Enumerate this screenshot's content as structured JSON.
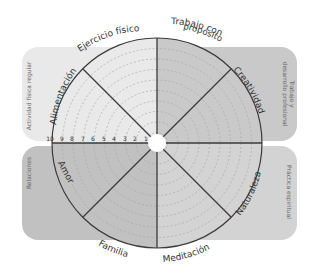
{
  "diagram": {
    "type": "wheel-of-life",
    "center": [
      157,
      143
    ],
    "radius": 105,
    "ring_count": 10,
    "scale_labels": [
      "10",
      "9",
      "8",
      "7",
      "6",
      "5",
      "4",
      "3",
      "2",
      "1"
    ],
    "segments": [
      {
        "label": "Ejercicio físico",
        "area": "top-left"
      },
      {
        "label": "Trabajo con propósito",
        "line1": "Trabajo con",
        "line2": "propósito",
        "area": "top-right"
      },
      {
        "label": "Creatividad",
        "area": "top-right"
      },
      {
        "label": "Naturaleza",
        "area": "bottom-right"
      },
      {
        "label": "Meditación",
        "area": "bottom-right"
      },
      {
        "label": "Familia",
        "area": "bottom-left"
      },
      {
        "label": "Amor",
        "area": "bottom-left"
      },
      {
        "label": "Alimentación",
        "area": "top-left"
      }
    ],
    "categories": [
      {
        "label": "Actividad física regular",
        "position": "top-left"
      },
      {
        "label": "Trabajo y desarrollo profesional",
        "line1": "Trabajo y",
        "line2": "desarrollo profesional",
        "position": "top-right"
      },
      {
        "label": "Relaciones",
        "position": "bottom-left"
      },
      {
        "label": "Práctica espiritual",
        "position": "bottom-right"
      }
    ],
    "colors": {
      "top_left": "#e9e9e9",
      "top_right": "#c9c9c9",
      "bottom_left": "#c1c1c1",
      "bottom_right": "#d3d3d3",
      "line": "#3a3a3a",
      "dashed": "#a8a8a8",
      "text": "#333333",
      "category_text": "#6a6a6a"
    }
  }
}
